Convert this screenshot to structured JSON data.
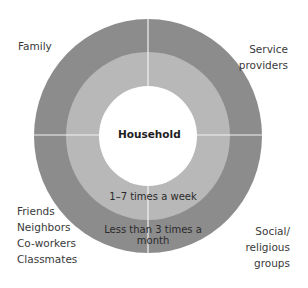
{
  "diagram": {
    "center": {
      "label": "Household"
    },
    "rings": [
      {
        "label": "1–7 times a week",
        "color": "#b8b8b8"
      },
      {
        "label": "Less than 3 times a month",
        "color": "#8c8c8c"
      }
    ],
    "quadrants": {
      "top_left": {
        "lines": [
          "Family"
        ]
      },
      "top_right": {
        "lines": [
          "Service",
          "providers"
        ]
      },
      "bottom_left": {
        "lines": [
          "Friends",
          "Neighbors",
          "Co-workers",
          "Classmates"
        ]
      },
      "bottom_right": {
        "lines": [
          "Social/",
          "religious",
          "groups"
        ]
      }
    },
    "divider_color": "#f2f2f2"
  }
}
